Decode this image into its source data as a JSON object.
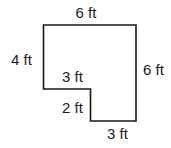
{
  "figure": {
    "type": "L-shaped polygon (rectilinear)",
    "units": "ft",
    "stroke_color": "#1a1a1a",
    "background": "#ffffff",
    "labels": {
      "top": "6 ft",
      "left": "4 ft",
      "right": "6 ft",
      "inner_horizontal": "3 ft",
      "inner_vertical": "2 ft",
      "bottom": "3 ft"
    }
  }
}
